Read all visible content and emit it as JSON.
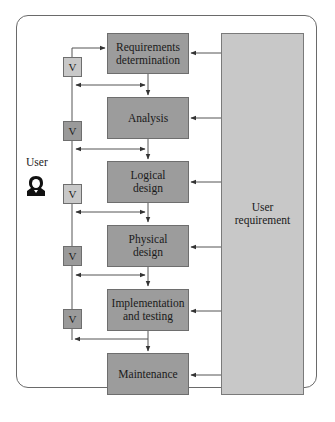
{
  "diagram": {
    "user_label": "User",
    "user_icon": "user-person-icon",
    "side_box_label_line1": "User",
    "side_box_label_line2": "requirement",
    "phases": [
      {
        "line1": "Requirements",
        "line2": "determination"
      },
      {
        "line1": "Analysis",
        "line2": ""
      },
      {
        "line1": "Logical",
        "line2": "design"
      },
      {
        "line1": "Physical",
        "line2": "design"
      },
      {
        "line1": "Implementation",
        "line2": "and testing"
      },
      {
        "line1": "Maintenance",
        "line2": ""
      }
    ],
    "verification_boxes": [
      {
        "label": "V",
        "shade": "light"
      },
      {
        "label": "V",
        "shade": "dark"
      },
      {
        "label": "V",
        "shade": "light"
      },
      {
        "label": "V",
        "shade": "dark"
      },
      {
        "label": "V",
        "shade": "dark"
      }
    ],
    "colors": {
      "phase_fill": "#9c9c9c",
      "side_fill": "#c8c8c8",
      "v_light": "#c8c8c8",
      "v_dark": "#9a9a9a",
      "line": "#555555"
    }
  }
}
